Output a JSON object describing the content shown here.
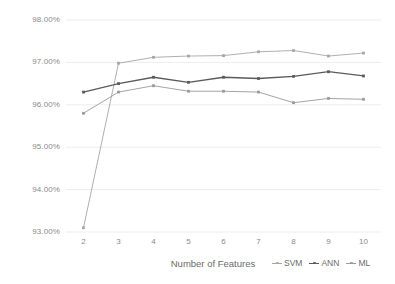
{
  "chart_data": {
    "type": "line",
    "title": "",
    "xlabel": "Number of Features",
    "ylabel": "",
    "x": [
      2,
      3,
      4,
      5,
      6,
      7,
      8,
      9,
      10
    ],
    "categories": [
      "2",
      "3",
      "4",
      "5",
      "6",
      "7",
      "8",
      "9",
      "10"
    ],
    "ylim": [
      93.0,
      98.0
    ],
    "ytick_labels": [
      "98.00%",
      "97.00%",
      "96.00%",
      "95.00%",
      "94.00%",
      "93.00%"
    ],
    "ytick_values": [
      98.0,
      97.0,
      96.0,
      95.0,
      94.0,
      93.0
    ],
    "grid": true,
    "legend_position": "bottom-right",
    "series": [
      {
        "name": "SVM",
        "color": "#a6a6a6",
        "values": [
          93.1,
          96.98,
          97.12,
          97.15,
          97.16,
          97.25,
          97.28,
          97.15,
          97.22
        ]
      },
      {
        "name": "ANN",
        "color": "#5a5a5a",
        "values": [
          96.3,
          96.5,
          96.65,
          96.53,
          96.65,
          96.62,
          96.67,
          96.78,
          96.68
        ]
      },
      {
        "name": "ML",
        "color": "#9a9a9a",
        "values": [
          95.8,
          96.3,
          96.45,
          96.32,
          96.32,
          96.3,
          96.05,
          96.15,
          96.13
        ]
      }
    ]
  },
  "axis": {
    "x_title": "Number of Features",
    "y_ticks": [
      "98.00%",
      "97.00%",
      "96.00%",
      "95.00%",
      "94.00%",
      "93.00%"
    ],
    "x_ticks": [
      "2",
      "3",
      "4",
      "5",
      "6",
      "7",
      "8",
      "9",
      "10"
    ]
  },
  "legend": {
    "items": [
      {
        "label": "SVM",
        "color": "#a6a6a6"
      },
      {
        "label": "ANN",
        "color": "#5a5a5a"
      },
      {
        "label": "ML",
        "color": "#9a9a9a"
      }
    ]
  },
  "colors": {
    "background": "#ffffff",
    "grid": "#ededed",
    "tick_text": "#8a8a8a",
    "title_text": "#6a6a6a"
  }
}
